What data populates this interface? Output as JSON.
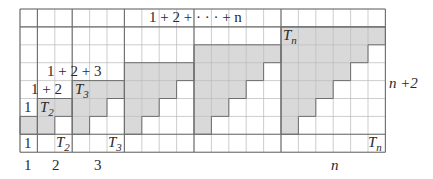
{
  "diagram": {
    "columns": 21,
    "rows": 8,
    "groups": [
      {
        "k": 1,
        "label_top": "1",
        "label_bottom": "1",
        "axis_label": "1"
      },
      {
        "k": 2,
        "label_top": "T",
        "label_top_sub": "2",
        "label_bottom": "T",
        "label_bottom_sub": "2",
        "axis_label": "2"
      },
      {
        "k": 3,
        "label_top": "T",
        "label_top_sub": "3",
        "label_bottom": "T",
        "label_bottom_sub": "3",
        "axis_label": "3"
      },
      {
        "k": 4
      },
      {
        "k": 5
      },
      {
        "k": "n",
        "label_top": "T",
        "label_top_sub": "n",
        "label_bottom": "T",
        "label_bottom_sub": "n",
        "axis_label": "n"
      }
    ],
    "sum_labels": {
      "s1": "1",
      "s2": "1 + 2",
      "s3": "1 + 2 + 3",
      "sn": "1 + 2 + · · · + n"
    },
    "height_label": "n +2",
    "colors": {
      "shade": "#d9d9d9",
      "grid": "#b8b8b8",
      "bold": "#6e6e6e",
      "background": "#ffffff"
    }
  }
}
